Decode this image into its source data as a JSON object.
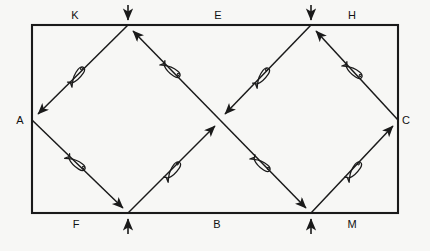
{
  "figure": {
    "title": "",
    "background_color": "#f7f7f5",
    "stroke_color": "#1a1a1a",
    "canvas": {
      "width": 430,
      "height": 251
    },
    "frame": {
      "name": "rectangle-border",
      "x": 32,
      "y": 25,
      "width": 366,
      "height": 188,
      "corners": {
        "top_left": [
          32,
          25
        ],
        "top_right": [
          398,
          25
        ],
        "bottom_right": [
          398,
          213
        ],
        "bottom_left": [
          32,
          213
        ]
      }
    },
    "nodes": [
      {
        "id": "A",
        "label": "A",
        "x": 32,
        "y": 120,
        "label_x": 20,
        "label_y": 124,
        "on": "left-edge"
      },
      {
        "id": "K",
        "label": "K",
        "x": 80,
        "y": 25,
        "label_x": 75,
        "label_y": 19,
        "on": "top-edge"
      },
      {
        "id": "E",
        "label": "E",
        "x": 220,
        "y": 25,
        "label_x": 218,
        "label_y": 19,
        "on": "top-edge"
      },
      {
        "id": "H",
        "label": "H",
        "x": 355,
        "y": 25,
        "label_x": 352,
        "label_y": 19,
        "on": "top-edge"
      },
      {
        "id": "C",
        "label": "C",
        "x": 398,
        "y": 120,
        "label_x": 406,
        "label_y": 124,
        "on": "right-edge"
      },
      {
        "id": "M",
        "label": "M",
        "x": 355,
        "y": 213,
        "label_x": 352,
        "label_y": 228,
        "on": "bottom-edge"
      },
      {
        "id": "B",
        "label": "B",
        "x": 220,
        "y": 213,
        "label_x": 217,
        "label_y": 228,
        "on": "bottom-edge"
      },
      {
        "id": "F",
        "label": "F",
        "x": 80,
        "y": 213,
        "label_x": 76,
        "label_y": 228,
        "on": "bottom-edge"
      }
    ],
    "zigzag_vertices": [
      {
        "name": "top-vertex-left",
        "x": 128,
        "y": 25,
        "arrow_direction": "down"
      },
      {
        "name": "top-vertex-right",
        "x": 311,
        "y": 25,
        "arrow_direction": "down"
      },
      {
        "name": "bottom-vertex-left",
        "x": 128,
        "y": 213,
        "arrow_direction": "up"
      },
      {
        "name": "bottom-vertex-right",
        "x": 311,
        "y": 213,
        "arrow_direction": "up"
      }
    ],
    "center_crossing": {
      "name": "center-crossing",
      "x": 220,
      "y": 120
    },
    "paths": [
      {
        "name": "path-top-vertex-left-to-A",
        "from": [
          128,
          25
        ],
        "to": [
          32,
          120
        ],
        "arrow_at": "to",
        "fish": true
      },
      {
        "name": "path-center-to-top-vertex-left",
        "from": [
          220,
          120
        ],
        "to": [
          128,
          25
        ],
        "arrow_at": "to",
        "fish": true
      },
      {
        "name": "path-top-vertex-right-to-center",
        "from": [
          311,
          25
        ],
        "to": [
          220,
          120
        ],
        "arrow_at": "to",
        "fish": true
      },
      {
        "name": "path-C-to-top-vertex-right",
        "from": [
          398,
          120
        ],
        "to": [
          311,
          25
        ],
        "arrow_at": "to",
        "fish": true
      },
      {
        "name": "path-A-to-bottom-vertex-left",
        "from": [
          32,
          120
        ],
        "to": [
          128,
          213
        ],
        "arrow_at": "to",
        "fish": true
      },
      {
        "name": "path-bottom-vertex-left-to-center",
        "from": [
          128,
          213
        ],
        "to": [
          220,
          120
        ],
        "arrow_at": "to",
        "fish": true
      },
      {
        "name": "path-center-to-bottom-vertex-right",
        "from": [
          220,
          120
        ],
        "to": [
          311,
          213
        ],
        "arrow_at": "to",
        "fish": true
      },
      {
        "name": "path-bottom-vertex-right-to-C",
        "from": [
          311,
          213
        ],
        "to": [
          398,
          120
        ],
        "arrow_at": "to",
        "fish": true
      }
    ],
    "fish_glyph": {
      "name": "fish-glyph",
      "count": 8,
      "description": "elongated teardrop fish outline straddling each diagonal segment"
    },
    "arrowhead_count": 12,
    "legend": ""
  }
}
